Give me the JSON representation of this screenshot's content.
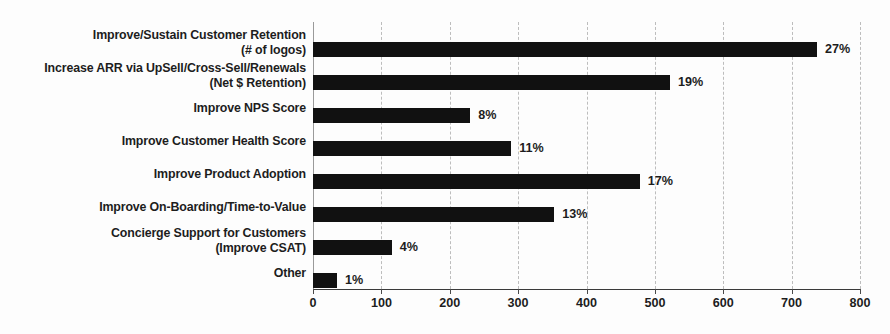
{
  "chart_data": {
    "type": "bar",
    "orientation": "horizontal",
    "title": "",
    "subtitle": "",
    "xlabel": "",
    "ylabel": "",
    "xlim": [
      0,
      800
    ],
    "xticks": [
      0,
      100,
      200,
      300,
      400,
      500,
      600,
      700,
      800
    ],
    "xtick_labels": [
      "0",
      "100",
      "200",
      "300",
      "400",
      "500",
      "600",
      "700",
      "800"
    ],
    "grid": true,
    "legend": false,
    "bar_color": "#111111",
    "categories": [
      "Improve/Sustain Customer Retention\n(# of logos)",
      "Increase ARR via UpSell/Cross-Sell/Renewals\n(Net $ Retention)",
      "Improve NPS Score",
      "Improve Customer Health Score",
      "Improve Product Adoption",
      "Improve On-Boarding/Time-to-Value",
      "Concierge Support for Customers\n(Improve CSAT)",
      "Other"
    ],
    "values": [
      737,
      522,
      230,
      290,
      478,
      353,
      115,
      35
    ],
    "data_labels": [
      "27%",
      "19%",
      "8%",
      "11%",
      "17%",
      "13%",
      "4%",
      "1%"
    ]
  }
}
